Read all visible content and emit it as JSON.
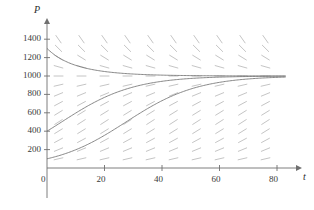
{
  "figure": {
    "kind": "slope-field-with-solution-curves",
    "background": "#ffffff",
    "axis_color": "#6f6f6f",
    "curve_color": "#7a7a7a",
    "slope_color": "#bdbdbd",
    "label_color": "#3a3a3a"
  },
  "axes": {
    "x_name": "t",
    "y_name": "P",
    "origin_label": "0",
    "x_ticks": [
      {
        "value": 20,
        "label": "20"
      },
      {
        "value": 40,
        "label": "40"
      },
      {
        "value": 60,
        "label": "60"
      },
      {
        "value": 80,
        "label": "80"
      }
    ],
    "y_ticks": [
      {
        "value": 200,
        "label": "200"
      },
      {
        "value": 400,
        "label": "400"
      },
      {
        "value": 600,
        "label": "600"
      },
      {
        "value": 800,
        "label": "800"
      },
      {
        "value": 1000,
        "label": "1000"
      },
      {
        "value": 1200,
        "label": "1200"
      },
      {
        "value": 1400,
        "label": "1400"
      }
    ]
  },
  "chart_data": {
    "type": "line",
    "title": "",
    "xlabel": "t",
    "ylabel": "P",
    "xlim": [
      0,
      85
    ],
    "ylim": [
      0,
      1480
    ],
    "grid": false,
    "legend": "none",
    "equilibrium": 1000,
    "growth_rate": 0.08,
    "field": {
      "type": "slope-field",
      "description": "Direction field of dP/dt = 0.08 P (1 - P/1000); segments slope down above P=1000, are horizontal at P=1000, and slope up below P=1000.",
      "x_samples": [
        4,
        12,
        20,
        28,
        36,
        44,
        52,
        60,
        68,
        76
      ],
      "y_samples": [
        100,
        200,
        300,
        400,
        500,
        600,
        700,
        800,
        900,
        1000,
        1100,
        1200,
        1300,
        1400
      ]
    },
    "series": [
      {
        "name": "P0 = 1300",
        "initial_value": 1300,
        "x": [
          0,
          5,
          10,
          15,
          20,
          25,
          30,
          35,
          40,
          50,
          60,
          70,
          80
        ],
        "values": [
          1300,
          1214,
          1153,
          1110,
          1080,
          1058,
          1042,
          1031,
          1022,
          1012,
          1005,
          1003,
          1001
        ]
      },
      {
        "name": "P0 = 400",
        "initial_value": 400,
        "x": [
          0,
          5,
          10,
          15,
          20,
          25,
          30,
          35,
          40,
          50,
          60,
          70,
          80
        ],
        "values": [
          400,
          501,
          602,
          695,
          773,
          835,
          882,
          916,
          941,
          971,
          986,
          993,
          997
        ]
      },
      {
        "name": "P0 = 100",
        "initial_value": 100,
        "x": [
          0,
          5,
          10,
          15,
          20,
          25,
          30,
          35,
          40,
          50,
          60,
          70,
          80
        ],
        "values": [
          100,
          146,
          210,
          294,
          396,
          508,
          617,
          714,
          793,
          899,
          953,
          979,
          991
        ]
      }
    ]
  }
}
